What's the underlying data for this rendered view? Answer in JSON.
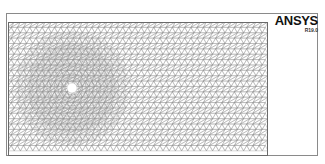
{
  "logo": {
    "title": "ANSYS",
    "version": "R19.0"
  },
  "mesh": {
    "domain": {
      "x": 8,
      "y": 22,
      "width": 260,
      "height": 134
    },
    "hole": {
      "cx": 72,
      "cy": 88,
      "r": 5
    },
    "element_type": "triangle",
    "line_color": "#8c8c8c",
    "border_color": "#6a6a6a"
  }
}
